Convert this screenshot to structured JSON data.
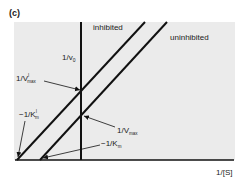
{
  "panel_label": "(c)",
  "plot": {
    "type": "Lineweaver-Burk double-reciprocal plot",
    "background": "#ebebeb",
    "line_color": "#111111",
    "x_axis_label": "1/[S]",
    "y_axis_label": "1/v",
    "y_axis_label_sub": "0",
    "lines": [
      {
        "name": "inhibited",
        "label": "inhibited"
      },
      {
        "name": "uninhibited",
        "label": "uninhibited"
      }
    ],
    "annotations": {
      "y_intercept_inhibited": {
        "main": "1/V",
        "sub": "max",
        "sup": "I"
      },
      "y_intercept_uninhibited": {
        "main": "1/V",
        "sub": "max"
      },
      "x_intercept_inhibited": {
        "main": "−1/K",
        "sub": "m",
        "sup": "I"
      },
      "x_intercept_uninhibited": {
        "main": "−1/K",
        "sub": "m"
      }
    }
  }
}
